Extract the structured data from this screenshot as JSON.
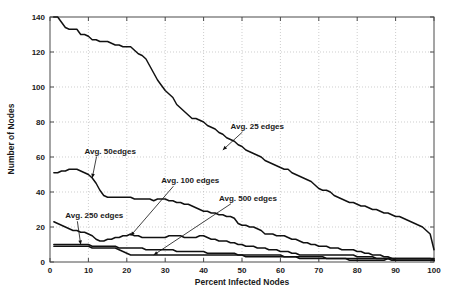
{
  "chart_data": {
    "type": "line",
    "title": "",
    "xlabel": "Percent Infected Nodes",
    "ylabel": "Number of Nodes",
    "xlim": [
      0,
      100
    ],
    "ylim": [
      0,
      140
    ],
    "xticks": [
      0,
      10,
      20,
      30,
      40,
      50,
      60,
      70,
      80,
      90,
      100
    ],
    "yticks": [
      0,
      20,
      40,
      60,
      80,
      100,
      120,
      140
    ],
    "grid": true,
    "legend_position": "inline-annotations",
    "line_color": "#111111",
    "annotations": [
      {
        "label": "Avg. 25 edges",
        "text_x": 47,
        "text_y": 76,
        "arrow_to_x": 45,
        "arrow_to_y": 64
      },
      {
        "label": "Avg. 50edges",
        "text_x": 9,
        "text_y": 62,
        "arrow_to_x": 11,
        "arrow_to_y": 48
      },
      {
        "label": "Avg. 100 edges",
        "text_x": 29,
        "text_y": 45,
        "arrow_to_x": 21,
        "arrow_to_y": 15
      },
      {
        "label": "Avg. 250 edges",
        "text_x": 4,
        "text_y": 25,
        "arrow_to_x": 8,
        "arrow_to_y": 10
      },
      {
        "label": "Avg. 500 edges",
        "text_x": 44,
        "text_y": 35,
        "arrow_to_x": 27,
        "arrow_to_y": 4
      }
    ],
    "series": [
      {
        "name": "Avg. 25 edges",
        "x": [
          1,
          2,
          3,
          4,
          5,
          6,
          7,
          8,
          9,
          10,
          11,
          12,
          13,
          14,
          15,
          16,
          17,
          18,
          19,
          20,
          21,
          22,
          23,
          24,
          25,
          26,
          27,
          28,
          29,
          30,
          31,
          32,
          33,
          34,
          35,
          36,
          37,
          38,
          39,
          40,
          41,
          42,
          43,
          44,
          45,
          46,
          47,
          48,
          49,
          50,
          51,
          52,
          53,
          54,
          55,
          56,
          57,
          58,
          59,
          60,
          61,
          62,
          63,
          64,
          65,
          66,
          67,
          68,
          69,
          70,
          71,
          72,
          73,
          74,
          75,
          76,
          77,
          78,
          79,
          80,
          81,
          82,
          83,
          84,
          85,
          86,
          87,
          88,
          89,
          90,
          91,
          92,
          93,
          94,
          95,
          96,
          97,
          98,
          99,
          100
        ],
        "y": [
          140,
          140,
          137,
          134,
          133,
          133,
          133,
          130,
          130,
          129,
          127,
          127,
          126,
          126,
          126,
          125,
          124,
          124,
          123,
          123,
          123,
          121,
          119,
          118,
          116,
          112,
          108,
          104,
          101,
          98,
          96,
          94,
          90,
          88,
          86,
          84,
          82,
          82,
          81,
          80,
          78,
          77,
          76,
          74,
          73,
          71,
          70,
          69,
          67,
          66,
          64,
          63,
          62,
          61,
          60,
          58,
          57,
          56,
          55,
          54,
          53,
          53,
          51,
          50,
          49,
          48,
          47,
          46,
          44,
          42,
          41,
          41,
          40,
          38,
          37,
          36,
          35,
          34,
          34,
          33,
          32,
          32,
          31,
          30,
          30,
          29,
          28,
          28,
          27,
          26,
          26,
          25,
          24,
          23,
          22,
          21,
          20,
          18,
          16,
          7
        ]
      },
      {
        "name": "Avg. 50edges",
        "x": [
          1,
          2,
          3,
          4,
          5,
          6,
          7,
          8,
          9,
          10,
          11,
          12,
          13,
          14,
          15,
          16,
          17,
          18,
          19,
          20,
          21,
          22,
          23,
          24,
          25,
          26,
          27,
          28,
          29,
          30,
          31,
          32,
          33,
          34,
          35,
          36,
          37,
          38,
          39,
          40,
          41,
          42,
          43,
          44,
          45,
          46,
          47,
          48,
          49,
          50,
          51,
          52,
          53,
          54,
          55,
          56,
          57,
          58,
          59,
          60,
          61,
          62,
          63,
          64,
          65,
          66,
          67,
          68,
          69,
          70,
          71,
          72,
          73,
          74,
          75,
          76,
          77,
          78,
          79,
          80,
          81,
          82,
          83,
          84,
          85,
          86,
          87,
          88,
          89,
          90,
          91,
          92,
          93,
          94,
          95,
          96,
          97,
          98,
          99,
          100
        ],
        "y": [
          51,
          51,
          52,
          52,
          53,
          53,
          53,
          52,
          51,
          50,
          48,
          45,
          41,
          38,
          37,
          37,
          37,
          37,
          37,
          37,
          37,
          36,
          36,
          36,
          36,
          36,
          35,
          36,
          36,
          36,
          35,
          35,
          34,
          34,
          33,
          33,
          32,
          31,
          30,
          29,
          29,
          28,
          28,
          27,
          27,
          26,
          26,
          25,
          22,
          21,
          21,
          20,
          20,
          19,
          18,
          16,
          16,
          16,
          15,
          15,
          15,
          14,
          13,
          13,
          12,
          11,
          11,
          10,
          10,
          9,
          9,
          9,
          8,
          8,
          8,
          7,
          7,
          7,
          7,
          6,
          6,
          5,
          5,
          4,
          4,
          4,
          3,
          3,
          2,
          2,
          2,
          2,
          2,
          2,
          2,
          2,
          2,
          2,
          2,
          2
        ]
      },
      {
        "name": "Avg. 100 edges",
        "x": [
          1,
          2,
          3,
          4,
          5,
          6,
          7,
          8,
          9,
          10,
          11,
          12,
          13,
          14,
          15,
          16,
          17,
          18,
          19,
          20,
          21,
          22,
          23,
          24,
          25,
          26,
          27,
          28,
          29,
          30,
          31,
          32,
          33,
          34,
          35,
          36,
          37,
          38,
          39,
          40,
          41,
          42,
          43,
          44,
          45,
          46,
          47,
          48,
          49,
          50,
          51,
          52,
          53,
          54,
          55,
          56,
          57,
          58,
          59,
          60,
          61,
          62,
          63,
          64,
          65,
          66,
          67,
          68,
          69,
          70,
          71,
          72,
          73,
          74,
          75,
          76,
          77,
          78,
          79,
          80,
          81,
          82,
          83,
          84,
          85,
          86,
          87,
          88,
          89,
          90,
          91,
          92,
          93,
          94,
          95,
          96,
          97,
          98,
          99,
          100
        ],
        "y": [
          23,
          22,
          21,
          20,
          19,
          18,
          18,
          17,
          17,
          16,
          15,
          13,
          12,
          12,
          13,
          13,
          14,
          14,
          15,
          15,
          16,
          15,
          15,
          14,
          14,
          14,
          14,
          14,
          14,
          14,
          15,
          15,
          15,
          15,
          14,
          14,
          14,
          14,
          15,
          15,
          14,
          13,
          13,
          12,
          12,
          12,
          11,
          11,
          10,
          10,
          9,
          9,
          9,
          8,
          8,
          8,
          7,
          7,
          7,
          6,
          6,
          6,
          5,
          5,
          4,
          4,
          4,
          4,
          4,
          4,
          4,
          4,
          4,
          4,
          4,
          4,
          4,
          4,
          4,
          3,
          3,
          3,
          3,
          3,
          2,
          2,
          2,
          2,
          2,
          2,
          2,
          2,
          2,
          2,
          2,
          2,
          2,
          2,
          2,
          1
        ]
      },
      {
        "name": "Avg. 250 edges",
        "x": [
          1,
          2,
          3,
          4,
          5,
          6,
          7,
          8,
          9,
          10,
          11,
          12,
          13,
          14,
          15,
          16,
          17,
          18,
          19,
          20,
          21,
          22,
          23,
          24,
          25,
          26,
          27,
          28,
          29,
          30,
          31,
          32,
          33,
          34,
          35,
          36,
          37,
          38,
          39,
          40,
          41,
          42,
          43,
          44,
          45,
          46,
          47,
          48,
          49,
          50,
          51,
          52,
          53,
          54,
          55,
          56,
          57,
          58,
          59,
          60,
          61,
          62,
          63,
          64,
          65,
          66,
          67,
          68,
          69,
          70,
          71,
          72,
          73,
          74,
          75,
          76,
          77,
          78,
          79,
          80,
          81,
          82,
          83,
          84,
          85,
          86,
          87,
          88,
          89,
          90,
          91,
          92,
          93,
          94,
          95,
          96,
          97,
          98,
          99,
          100
        ],
        "y": [
          10,
          10,
          10,
          10,
          10,
          10,
          10,
          10,
          10,
          10,
          9,
          9,
          9,
          9,
          9,
          9,
          9,
          8,
          8,
          8,
          8,
          8,
          8,
          8,
          7,
          7,
          7,
          7,
          7,
          7,
          7,
          7,
          6,
          6,
          6,
          6,
          6,
          6,
          6,
          6,
          5,
          5,
          5,
          5,
          5,
          5,
          5,
          5,
          4,
          4,
          4,
          4,
          4,
          4,
          4,
          4,
          4,
          4,
          4,
          4,
          3,
          3,
          3,
          3,
          3,
          3,
          3,
          3,
          3,
          3,
          3,
          2,
          2,
          2,
          2,
          2,
          2,
          2,
          2,
          2,
          2,
          2,
          2,
          2,
          2,
          2,
          2,
          2,
          1,
          1,
          1,
          1,
          1,
          1,
          1,
          1,
          1,
          1,
          1,
          1
        ]
      },
      {
        "name": "Avg. 500 edges",
        "x": [
          1,
          2,
          3,
          4,
          5,
          6,
          7,
          8,
          9,
          10,
          11,
          12,
          13,
          14,
          15,
          16,
          17,
          18,
          19,
          20,
          21,
          22,
          23,
          24,
          25,
          26,
          27,
          28,
          29,
          30,
          31,
          32,
          33,
          34,
          35,
          36,
          37,
          38,
          39,
          40,
          41,
          42,
          43,
          44,
          45,
          46,
          47,
          48,
          49,
          50,
          51,
          52,
          53,
          54,
          55,
          56,
          57,
          58,
          59,
          60,
          61,
          62,
          63,
          64,
          65,
          66,
          67,
          68,
          69,
          70,
          71,
          72,
          73,
          74,
          75,
          76,
          77,
          78,
          79,
          80,
          81,
          82,
          83,
          84,
          85,
          86,
          87,
          88,
          89,
          90,
          91,
          92,
          93,
          94,
          95,
          96,
          97,
          98,
          99,
          100
        ],
        "y": [
          9,
          9,
          9,
          9,
          9,
          9,
          9,
          9,
          9,
          9,
          8,
          8,
          8,
          8,
          8,
          8,
          8,
          7,
          6,
          5,
          4,
          4,
          4,
          4,
          4,
          4,
          4,
          4,
          4,
          4,
          4,
          4,
          4,
          4,
          4,
          4,
          4,
          4,
          4,
          4,
          4,
          4,
          4,
          4,
          4,
          4,
          4,
          4,
          4,
          4,
          3,
          3,
          3,
          3,
          3,
          3,
          3,
          3,
          3,
          3,
          3,
          3,
          3,
          3,
          2,
          2,
          2,
          2,
          2,
          2,
          2,
          2,
          2,
          2,
          2,
          2,
          2,
          1,
          1,
          1,
          1,
          1,
          1,
          1,
          1,
          1,
          1,
          2,
          2,
          1,
          1,
          1,
          1,
          1,
          1,
          1,
          1,
          1,
          1,
          1
        ]
      }
    ]
  }
}
